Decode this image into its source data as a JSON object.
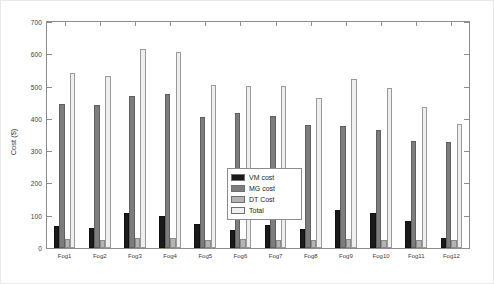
{
  "chart_data": {
    "type": "bar",
    "title": "",
    "xlabel": "",
    "ylabel": "Cost ($)",
    "ylim": [
      0,
      700
    ],
    "ytick_values": [
      0,
      100,
      200,
      300,
      400,
      500,
      600,
      700
    ],
    "ytick_labels": [
      "0",
      "100",
      "200",
      "300",
      "400",
      "500",
      "600",
      "700"
    ],
    "grid": false,
    "legend_position": "center",
    "categories": [
      "Fog1",
      "Fog2",
      "Fog3",
      "Fog4",
      "Fog5",
      "Fog6",
      "Fog7",
      "Fog8",
      "Fog9",
      "Fog10",
      "Fog11",
      "Fog12"
    ],
    "series": [
      {
        "name": "VM cost",
        "color": "#1a1a1a",
        "values": [
          68,
          63,
          108,
          98,
          75,
          55,
          70,
          58,
          118,
          108,
          83,
          32
        ]
      },
      {
        "name": "MG cost",
        "color": "#7d7d7d",
        "values": [
          445,
          442,
          472,
          478,
          405,
          418,
          408,
          382,
          378,
          365,
          330,
          327
        ]
      },
      {
        "name": "DT Cost",
        "color": "#b4b4b4",
        "values": [
          28,
          25,
          30,
          30,
          25,
          28,
          25,
          25,
          28,
          25,
          25,
          25
        ]
      },
      {
        "name": "Total",
        "color": "#efefef",
        "values": [
          542,
          533,
          617,
          608,
          505,
          503,
          503,
          465,
          523,
          497,
          437,
          385
        ]
      }
    ]
  },
  "legend": {
    "items": [
      {
        "label": "VM cost"
      },
      {
        "label": "MG cost"
      },
      {
        "label": "DT Cost"
      },
      {
        "label": "Total"
      }
    ]
  }
}
